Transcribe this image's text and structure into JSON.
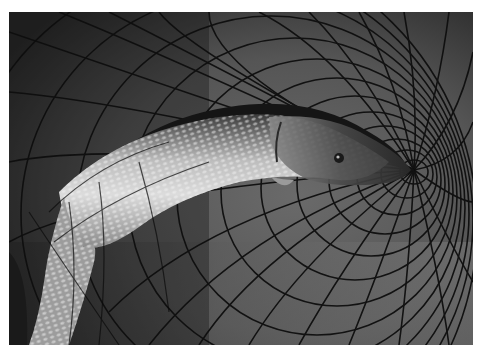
{
  "image": {
    "description": "Black-and-white photograph of a northern pike lying in a funnel-shaped fishing net; the mesh converges toward the fish's snout on the right.",
    "subject": "pike fish in net",
    "palette": {
      "background_dark": "#1e1e1e",
      "background_mid": "#5a5a5a",
      "background_light": "#7a7a7a",
      "fish_light": "#d8d8d8",
      "fish_dark": "#2a2a2a",
      "net": "#0e0e0e",
      "border": "#ffffff"
    }
  }
}
